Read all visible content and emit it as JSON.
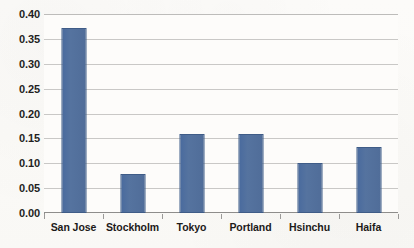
{
  "chart_data": {
    "type": "bar",
    "title": "",
    "subtitle": "",
    "xlabel": "",
    "ylabel": "",
    "categories": [
      "San Jose",
      "Stockholm",
      "Tokyo",
      "Portland",
      "Hsinchu",
      "Haifa"
    ],
    "values": [
      0.371,
      0.078,
      0.158,
      0.159,
      0.1,
      0.133
    ],
    "series": [
      {
        "name": "",
        "values": [
          0.371,
          0.078,
          0.158,
          0.159,
          0.1,
          0.133
        ]
      }
    ],
    "ylim": [
      0.0,
      0.4
    ],
    "ytick_step": 0.05,
    "ytick_labels": [
      "0.00",
      "0.05",
      "0.10",
      "0.15",
      "0.20",
      "0.25",
      "0.30",
      "0.35",
      "0.40"
    ],
    "ytick_values": [
      0.0,
      0.05,
      0.1,
      0.15,
      0.2,
      0.25,
      0.3,
      0.35,
      0.4
    ],
    "grid": true,
    "grid_axis": "y",
    "legend": false,
    "legend_position": "none",
    "bar_color": "#4F6FA3",
    "bar_border_color": "#3F5C87",
    "gridline_color": "#C9C8C6",
    "axis_color": "#8E8D8B",
    "text_color": "#1D1A19",
    "background_color": "#FDFCFA",
    "annotations": []
  }
}
